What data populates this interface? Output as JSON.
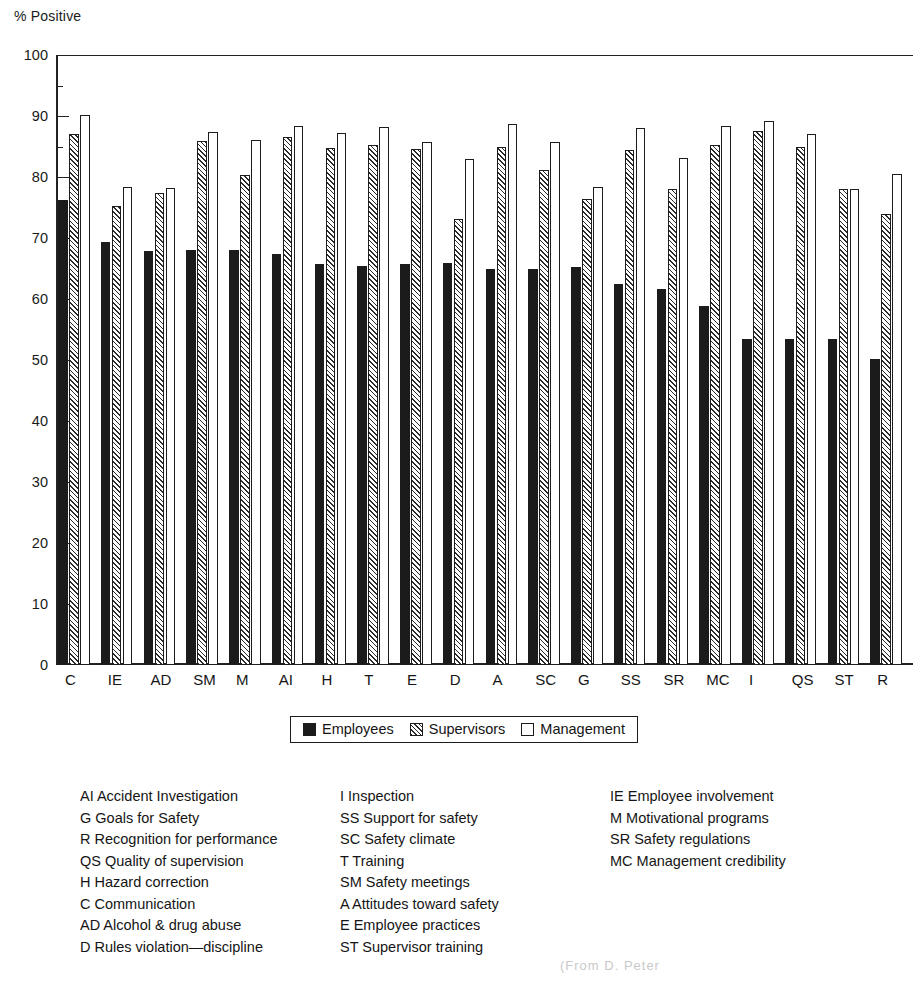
{
  "chart_data": {
    "type": "bar",
    "title": "",
    "ylabel": "% Positive",
    "xlabel": "",
    "ylim": [
      0,
      100
    ],
    "ytick_step": 10,
    "yminor_step": 5,
    "grid": false,
    "legend_position": "below-axis-center",
    "categories": [
      "C",
      "IE",
      "AD",
      "SM",
      "M",
      "AI",
      "H",
      "T",
      "E",
      "D",
      "A",
      "SC",
      "G",
      "SS",
      "SR",
      "MC",
      "I",
      "QS",
      "ST",
      "R"
    ],
    "ytick_labels": [
      "0",
      "10",
      "20",
      "30",
      "40",
      "50",
      "60",
      "70",
      "80",
      "90",
      "100"
    ],
    "series": [
      {
        "name": "Employees",
        "pattern": "solid-black",
        "color": "#1b1b1b",
        "values": [
          76.2,
          69.3,
          67.9,
          68.1,
          68.1,
          67.3,
          65.8,
          65.4,
          65.7,
          65.9,
          64.9,
          65.0,
          65.2,
          62.5,
          61.6,
          58.8,
          53.4,
          53.4,
          53.5,
          50.2
        ]
      },
      {
        "name": "Supervisors",
        "pattern": "diagonal-hatch",
        "color": "#f2f2f2",
        "values": [
          87.0,
          75.3,
          77.4,
          85.9,
          80.4,
          86.5,
          84.7,
          85.3,
          84.6,
          73.1,
          84.9,
          81.2,
          76.4,
          84.4,
          78.0,
          85.2,
          87.6,
          84.9,
          78.1,
          74.0
        ]
      },
      {
        "name": "Management",
        "pattern": "white",
        "color": "#ffffff",
        "values": [
          90.2,
          78.3,
          78.2,
          87.3,
          86.0,
          88.4,
          87.2,
          88.2,
          85.8,
          83.0,
          88.7,
          85.8,
          78.4,
          88.0,
          83.1,
          88.3,
          89.2,
          87.0,
          78.0,
          80.5
        ]
      }
    ]
  },
  "y_axis": {
    "title": "% Positive"
  },
  "legend": {
    "entries": [
      {
        "label": "Employees",
        "swatch": "solid-black-swatch"
      },
      {
        "label": "Supervisors",
        "swatch": "hatched-swatch"
      },
      {
        "label": "Management",
        "swatch": "white-swatch"
      }
    ]
  },
  "key": {
    "columns": [
      {
        "items": [
          "AI Accident Investigation",
          "G Goals for Safety",
          "R Recognition for performance",
          "QS Quality of supervision",
          "H Hazard correction",
          "C Communication",
          "AD Alcohol & drug abuse",
          "D Rules violation—discipline"
        ]
      },
      {
        "items": [
          "I Inspection",
          "SS Support for safety",
          "SC Safety climate",
          "T Training",
          "SM Safety meetings",
          "A Attitudes toward safety",
          "E Employee practices",
          "ST Supervisor training"
        ]
      },
      {
        "items": [
          "IE Employee involvement",
          "M Motivational programs",
          "SR Safety regulations",
          "MC Management credibility"
        ]
      }
    ]
  },
  "caption_fragment": "(From D. Peter"
}
